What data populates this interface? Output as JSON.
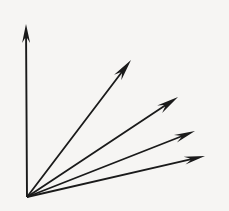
{
  "canvas": {
    "width": 229,
    "height": 211,
    "background_color": "#f6f5f3",
    "stroke_color": "#1a1a1a"
  },
  "chart_data": {
    "type": "diagram",
    "subtype": "vector-fan",
    "title": "",
    "xlabel": "",
    "ylabel": "",
    "origin": {
      "x": 27,
      "y": 197
    },
    "grid": false,
    "legend": null,
    "annotations": [],
    "vectors": [
      {
        "name": "vertical-axis-arrow",
        "label": "",
        "tip": {
          "x": 26,
          "y": 24
        },
        "angle_deg": 90.3,
        "length_px": 173,
        "shaft_width_px": 1.9,
        "head_length_px": 19,
        "head_width_px": 8,
        "head_barb_px": 5
      },
      {
        "name": "diagonal-arrow-1",
        "label": "",
        "tip": {
          "x": 131,
          "y": 60
        },
        "angle_deg": 52.5,
        "length_px": 172,
        "shaft_width_px": 1.8,
        "head_length_px": 22,
        "head_width_px": 9,
        "head_barb_px": 6
      },
      {
        "name": "diagonal-arrow-2",
        "label": "",
        "tip": {
          "x": 178,
          "y": 97
        },
        "angle_deg": 33.6,
        "length_px": 181,
        "shaft_width_px": 1.8,
        "head_length_px": 22,
        "head_width_px": 9,
        "head_barb_px": 6
      },
      {
        "name": "diagonal-arrow-3",
        "label": "",
        "tip": {
          "x": 195,
          "y": 131
        },
        "angle_deg": 21.5,
        "length_px": 180,
        "shaft_width_px": 1.8,
        "head_length_px": 21,
        "head_width_px": 8,
        "head_barb_px": 6
      },
      {
        "name": "diagonal-arrow-4",
        "label": "",
        "tip": {
          "x": 205,
          "y": 156
        },
        "angle_deg": 13.8,
        "length_px": 183,
        "shaft_width_px": 1.8,
        "head_length_px": 21,
        "head_width_px": 8,
        "head_barb_px": 6
      }
    ]
  }
}
